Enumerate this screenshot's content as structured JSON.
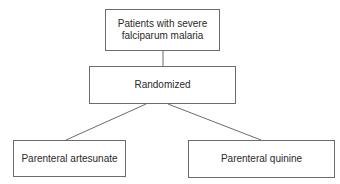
{
  "diagram": {
    "type": "flowchart",
    "nodes": {
      "population": {
        "label": "Patients with severe falciparum malaria"
      },
      "randomization": {
        "label": "Randomized"
      },
      "arm_a": {
        "label": "Parenteral artesunate"
      },
      "arm_b": {
        "label": "Parenteral quinine"
      }
    },
    "edges": [
      {
        "from": "population",
        "to": "randomization"
      },
      {
        "from": "randomization",
        "to": "arm_a"
      },
      {
        "from": "randomization",
        "to": "arm_b"
      }
    ],
    "colors": {
      "border": "#6b6b6b",
      "text": "#2a2a2a",
      "line": "#6b6b6b",
      "background": "#ffffff"
    }
  }
}
